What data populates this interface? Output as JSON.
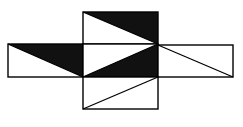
{
  "diagram": {
    "type": "cube-net",
    "colors": {
      "stroke": "#000000",
      "fill_dark": "#111111",
      "fill_light": "#ffffff",
      "background": "#ffffff"
    },
    "faces": [
      {
        "name": "top-face",
        "rect": [
          83,
          12,
          75,
          32
        ],
        "diagonal": [
          83,
          12,
          158,
          44
        ],
        "shaded": [
          [
            83,
            12
          ],
          [
            158,
            12
          ],
          [
            158,
            44
          ]
        ]
      },
      {
        "name": "left-face",
        "rect": [
          8,
          44,
          75,
          33
        ],
        "diagonal": [
          8,
          44,
          83,
          77
        ],
        "shaded": [
          [
            8,
            44
          ],
          [
            83,
            44
          ],
          [
            83,
            77
          ]
        ]
      },
      {
        "name": "center-face",
        "rect": [
          83,
          44,
          75,
          33
        ],
        "diagonal": [
          83,
          77,
          158,
          44
        ],
        "shaded": [
          [
            83,
            77
          ],
          [
            158,
            44
          ],
          [
            158,
            77
          ]
        ]
      },
      {
        "name": "right-face",
        "rect": [
          158,
          45,
          75,
          32
        ],
        "diagonal": [
          158,
          45,
          233,
          77
        ],
        "shaded": null
      },
      {
        "name": "bottom-face",
        "rect": [
          83,
          77,
          75,
          32
        ],
        "diagonal": [
          83,
          109,
          158,
          77
        ],
        "shaded": null
      }
    ]
  }
}
